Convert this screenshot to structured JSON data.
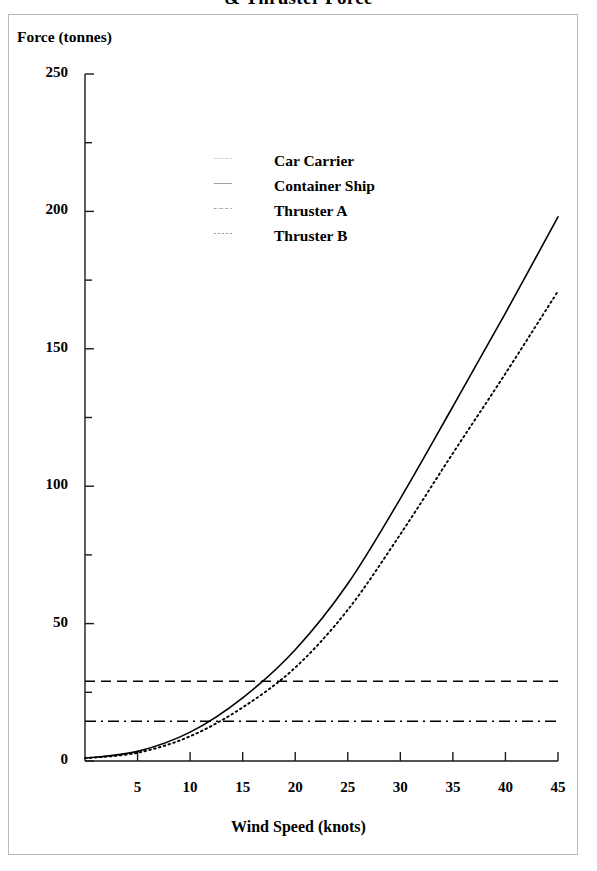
{
  "title": "& Thruster Force",
  "axes": {
    "y_title": "Force (tonnes)",
    "x_title": "Wind Speed (knots)",
    "y_ticks": [
      "0",
      "50",
      "100",
      "150",
      "200",
      "250"
    ],
    "x_ticks": [
      "5",
      "10",
      "15",
      "20",
      "25",
      "30",
      "35",
      "40",
      "45"
    ]
  },
  "legend": {
    "items": [
      {
        "label": "Car Carrier",
        "style": "dotted",
        "color": "#000000"
      },
      {
        "label": "Container Ship",
        "style": "solid",
        "color": "#000000"
      },
      {
        "label": "Thruster A",
        "style": "dashdot",
        "color": "#000000"
      },
      {
        "label": "Thruster B",
        "style": "dashed",
        "color": "#000000"
      }
    ]
  },
  "chart_data": {
    "type": "line",
    "title": "& Thruster Force",
    "xlabel": "Wind Speed (knots)",
    "ylabel": "Force (tonnes)",
    "xlim": [
      0,
      45
    ],
    "ylim": [
      0,
      250
    ],
    "grid": false,
    "legend_position": "upper-center",
    "x_major_tick_step": 5,
    "y_major_tick_step": 50,
    "y_minor_tick_step": 25,
    "x": [
      0,
      5,
      10,
      15,
      20,
      25,
      30,
      35,
      40,
      45
    ],
    "series": [
      {
        "name": "Container Ship",
        "style": "solid",
        "color": "#000000",
        "values": [
          1.0,
          3.5,
          10.5,
          23.0,
          40.5,
          64.5,
          95.5,
          129.0,
          163.0,
          198.0
        ]
      },
      {
        "name": "Car Carrier",
        "style": "dotted",
        "color": "#000000",
        "values": [
          1.0,
          3.0,
          9.0,
          19.5,
          34.0,
          55.0,
          82.5,
          112.0,
          141.0,
          171.0
        ]
      },
      {
        "name": "Thruster A",
        "style": "dashdot",
        "color": "#000000",
        "constant": 14.5,
        "values": [
          14.5,
          14.5,
          14.5,
          14.5,
          14.5,
          14.5,
          14.5,
          14.5,
          14.5,
          14.5
        ]
      },
      {
        "name": "Thruster B",
        "style": "dashed",
        "color": "#000000",
        "constant": 29.0,
        "values": [
          29.0,
          29.0,
          29.0,
          29.0,
          29.0,
          29.0,
          29.0,
          29.0,
          29.0,
          29.0
        ]
      }
    ],
    "annotations": [
      "Container Ship wind force exceeds Thruster A capacity at about 11.5 knots",
      "Container Ship wind force exceeds Thruster B capacity at about 16 knots",
      "Car Carrier wind force exceeds Thruster A capacity at about 12.5 knots",
      "Car Carrier wind force exceeds Thruster B capacity at about 18 knots"
    ]
  },
  "geometry": {
    "plot_left": 85,
    "plot_right": 558,
    "plot_bottom": 761,
    "plot_top": 74
  }
}
